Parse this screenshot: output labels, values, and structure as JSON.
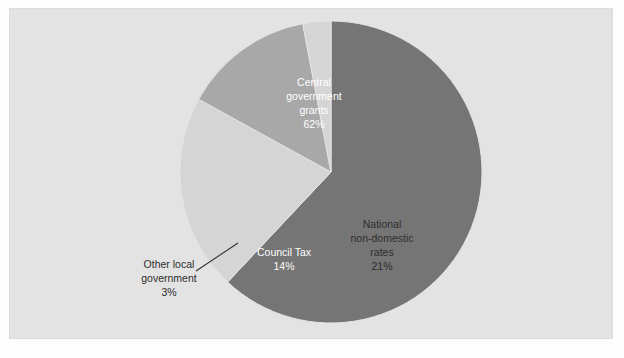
{
  "figure": {
    "background_color": "#fdfdfd",
    "panel_color": "#e3e3e3"
  },
  "chart_data": {
    "type": "pie",
    "title": "",
    "subtitle": "",
    "xlabel": "",
    "ylabel": "",
    "grid": false,
    "legend_position": "none",
    "units": "percent",
    "label_format": "{name}\n{value}%",
    "start_angle_deg": 0,
    "direction": "clockwise",
    "center": {
      "x": 331,
      "y": 172
    },
    "radius": 151,
    "categories": [
      "Central government grants",
      "National non-domestic rates",
      "Council Tax",
      "Other local government"
    ],
    "values": [
      62,
      21,
      14,
      3
    ],
    "colors": [
      "#757575",
      "#d5d5d5",
      "#a8a8a8",
      "#d5d5d5"
    ],
    "slices": [
      {
        "name": "Central government grants",
        "label_lines": [
          "Central",
          "government",
          "grants"
        ],
        "value": 62,
        "value_label": "62%",
        "color": "#757575",
        "text_color": "#ffffff",
        "label_x": 314,
        "label_y": 86,
        "callout": false
      },
      {
        "name": "National non-domestic rates",
        "label_lines": [
          "National",
          "non-domestic",
          "rates"
        ],
        "value": 21,
        "value_label": "21%",
        "color": "#d5d5d5",
        "text_color": "#2e2e2e",
        "label_x": 382,
        "label_y": 228,
        "callout": false
      },
      {
        "name": "Council Tax",
        "label_lines": [
          "Council Tax"
        ],
        "value": 14,
        "value_label": "14%",
        "color": "#a8a8a8",
        "text_color": "#ffffff",
        "label_x": 284,
        "label_y": 256,
        "callout": false
      },
      {
        "name": "Other local government",
        "label_lines": [
          "Other local",
          "government"
        ],
        "value": 3,
        "value_label": "3%",
        "color": "#d5d5d5",
        "text_color": "#2e2e2e",
        "label_x": 169,
        "label_y": 268,
        "callout": true,
        "leader_from_x": 196,
        "leader_from_y": 271,
        "leader_to_x": 238,
        "leader_to_y": 243
      }
    ]
  }
}
